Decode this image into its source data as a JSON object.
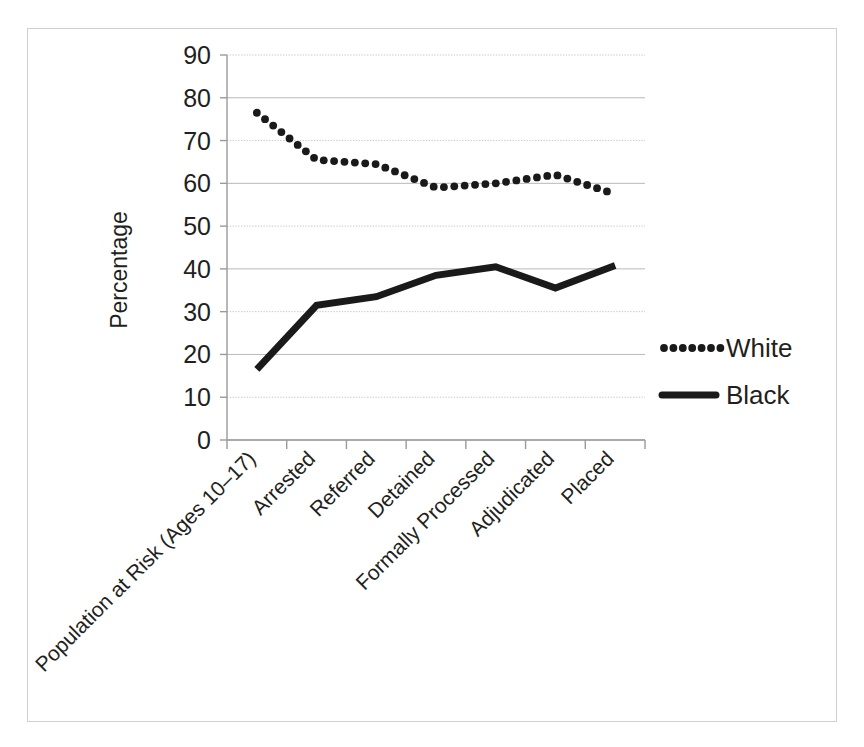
{
  "chart_data": {
    "type": "line",
    "title": "",
    "subtitle": "",
    "xlabel": "",
    "ylabel": "Percentage",
    "ylim": [
      0,
      90
    ],
    "ytick_labels": [
      "0",
      "10",
      "20",
      "30",
      "40",
      "50",
      "60",
      "70",
      "80",
      "90"
    ],
    "ytick_values": [
      0,
      10,
      20,
      30,
      40,
      50,
      60,
      70,
      80,
      90
    ],
    "grid": true,
    "grid_axis": "y",
    "legend_position": "right",
    "categories": [
      "Population at Risk (Ages 10–17)",
      "Arrested",
      "Referred",
      "Detained",
      "Formally Processed",
      "Adjudicated",
      "Placed"
    ],
    "series": [
      {
        "name": "White",
        "style": "dotted",
        "color": "#1a1a1a",
        "values": [
          76.5,
          65.5,
          64.5,
          59.0,
          60.0,
          62.0,
          57.5
        ]
      },
      {
        "name": "Black",
        "style": "solid",
        "color": "#1a1a1a",
        "values": [
          16.5,
          31.5,
          33.5,
          38.5,
          40.5,
          35.5,
          40.8
        ]
      }
    ]
  },
  "legend": {
    "entries": [
      {
        "label": "White",
        "marker": "dotted-line"
      },
      {
        "label": "Black",
        "marker": "solid-line"
      }
    ]
  },
  "axes": {
    "y_title": "Percentage"
  }
}
